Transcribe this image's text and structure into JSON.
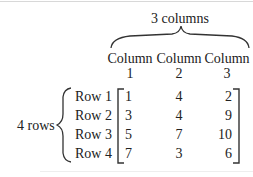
{
  "columns_label": "3 columns",
  "rows_label": "4 rows",
  "column_headers": [
    {
      "line1": "Column",
      "line2": "1"
    },
    {
      "line1": "Column",
      "line2": "2"
    },
    {
      "line1": "Column",
      "line2": "3"
    }
  ],
  "row_labels": [
    "Row 1",
    "Row 2",
    "Row 3",
    "Row 4"
  ],
  "matrix": [
    [
      "1",
      "4",
      "2"
    ],
    [
      "3",
      "4",
      "9"
    ],
    [
      "5",
      "7",
      "10"
    ],
    [
      "7",
      "3",
      "6"
    ]
  ]
}
